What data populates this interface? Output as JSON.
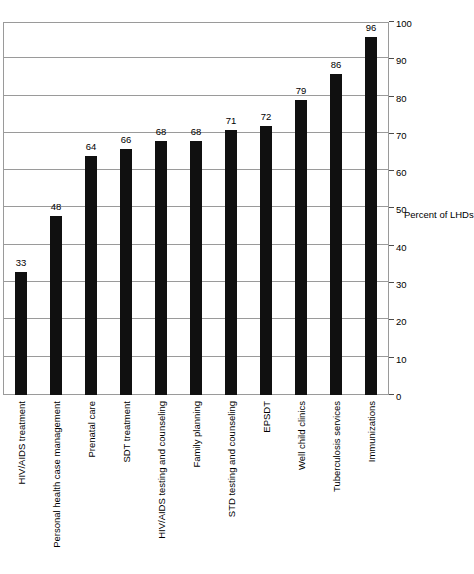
{
  "chart_data": {
    "type": "bar",
    "title": "",
    "subtitle": "",
    "orientation": "rotated-90",
    "categories": [
      "HIV/AIDS treatment",
      "Personal health case management",
      "Prenatal care",
      "SDT treatment",
      "HIV/AIDS testing and counseling",
      "Family planning",
      "STD testing and counseling",
      "EPSDT",
      "Well child clinics",
      "Tuberculosis services",
      "Immunizations"
    ],
    "values": [
      33,
      48,
      64,
      66,
      68,
      68,
      71,
      72,
      79,
      86,
      96
    ],
    "data_labels": [
      "33",
      "48",
      "64",
      "66",
      "68",
      "68",
      "71",
      "72",
      "79",
      "86",
      "96"
    ],
    "xlabel": "",
    "ylabel": "Percent of LHDs",
    "ylim": [
      0,
      100
    ],
    "yticks": [
      0,
      10,
      20,
      30,
      40,
      50,
      60,
      70,
      80,
      90,
      100
    ],
    "ytick_labels": [
      "0",
      "10",
      "20",
      "30",
      "40",
      "50",
      "60",
      "70",
      "80",
      "90",
      "100"
    ],
    "grid": true,
    "grid_axis": "value",
    "legend": false,
    "legend_position": "none",
    "bar_color": "#101010",
    "grid_color": "#9a9a9a",
    "frame_color": "#9a9a9a",
    "background_color": "#ffffff"
  }
}
